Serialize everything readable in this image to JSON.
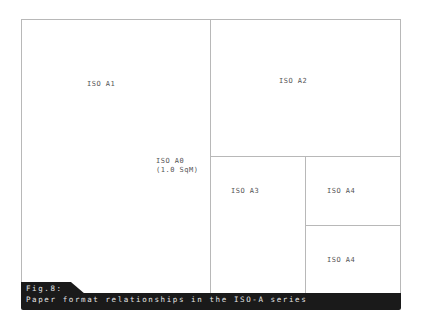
{
  "diagram": {
    "regions": [
      {
        "id": "a1",
        "label": "ISO A1"
      },
      {
        "id": "a0",
        "label": "ISO A0",
        "sublabel": "(1.0 SqM)"
      },
      {
        "id": "a2",
        "label": "ISO A2"
      },
      {
        "id": "a3",
        "label": "ISO A3"
      },
      {
        "id": "a4_top",
        "label": "ISO A4"
      },
      {
        "id": "a4_bottom",
        "label": "ISO A4"
      }
    ],
    "line_color": "#b8b8b8"
  },
  "caption": {
    "figure": "Fig.8:",
    "text": "Paper format relationships in the ISO-A series",
    "background": "#1a1a1a"
  }
}
